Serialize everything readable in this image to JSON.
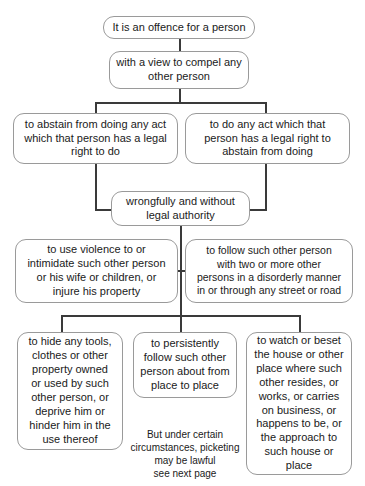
{
  "diagram": {
    "colors": {
      "box_border": "#9a9a9a",
      "connector": "#3a3a3a",
      "text": "#1a1a1a",
      "background": "#ffffff"
    },
    "nodes": [
      {
        "id": "offence",
        "text": "It is an offence for a person"
      },
      {
        "id": "compel",
        "text": "with a view to compel any\nother person"
      },
      {
        "id": "abstain",
        "text": "to abstain from doing any act\nwhich that person has a legal\nright to do"
      },
      {
        "id": "do-any-act",
        "text": "to do any act which that\nperson has a legal right to\nabstain from doing"
      },
      {
        "id": "wrongfully",
        "text": "wrongfully and without\nlegal authority"
      },
      {
        "id": "violence",
        "text": "to use violence to or\nintimidate such other person\nor his wife or children, or\ninjure his property"
      },
      {
        "id": "follow-disorderly",
        "text": "to follow such other person\nwith two or more other\npersons in a disorderly manner\nin or through any street or road"
      },
      {
        "id": "hide-tools",
        "text": "to hide any tools,\nclothes or other\nproperty owned\nor used by such\nother person, or\ndeprive him or\nhinder him in the\nuse thereof"
      },
      {
        "id": "persistently-follow",
        "text": "to persistently\nfollow such other\nperson about from\nplace to place"
      },
      {
        "id": "watch-beset",
        "text": "to watch or beset\nthe house or other\nplace where such\nother resides, or\nworks, or carries\non business, or\nhappens to be, or\nthe approach to\nsuch house or\nplace"
      }
    ],
    "notes": [
      {
        "id": "picketing-note",
        "text": "But under certain\ncircumstances, picketing\nmay be lawful\nsee next page"
      }
    ]
  }
}
